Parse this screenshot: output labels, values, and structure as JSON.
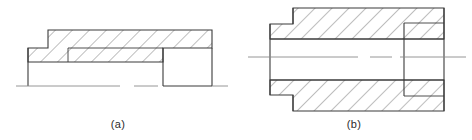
{
  "sheet": {
    "width": 472,
    "height": 140,
    "background": "#ffffff",
    "line_color": "#3a3a3a",
    "hatch_color": "#6f6f6f",
    "centerline_color": "#8a8a8a",
    "title": "Sectional views of stepped parts"
  },
  "figures": [
    {
      "id": "a",
      "caption": "(a)",
      "type": "half-section-stepped-block",
      "description": "Stepped block shown in section with 45 degree hatching, open notch at right, horizontal baseline",
      "outline_points": "28,82 28,48 48,48 48,30 84,30 84,48",
      "hatch_angle_deg": 45,
      "hatch_spacing_px": 12,
      "body": {
        "left_x": 28,
        "right_x": 212,
        "top_y": 30,
        "step_top_y": 48,
        "step_x": 48,
        "shoulder_x": 68,
        "bottom_y": 62,
        "base_y": 86
      },
      "notch": {
        "left_x": 163,
        "right_x": 212,
        "top_y": 48,
        "bottom_y": 86
      }
    },
    {
      "id": "b",
      "caption": "(b)",
      "type": "full-section-bushing",
      "description": "Symmetric bushing full section with bore, counterbore at right and reduced spigot at left",
      "hatch_angle_deg": 45,
      "hatch_spacing_px": 12,
      "body": {
        "left_x": 270,
        "right_x": 444,
        "top_y": 8,
        "bottom_y": 111,
        "flange_x": 293,
        "spigot_outer_top_y": 24,
        "spigot_outer_bottom_y": 95,
        "bore_top_y": 39,
        "bore_bottom_y": 80
      },
      "counterbore": {
        "x": 404,
        "top_y": 23,
        "bottom_y": 96
      },
      "centerline": {
        "y": 57,
        "x_start": 248,
        "x_end": 466
      }
    }
  ],
  "captions": {
    "a": "(a)",
    "b": "(b)"
  }
}
